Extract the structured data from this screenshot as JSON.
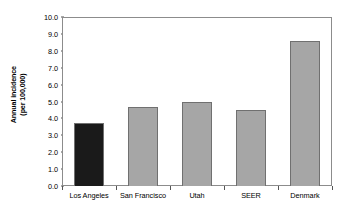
{
  "chart_data": {
    "type": "bar",
    "title": "",
    "subtitle": "",
    "xlabel": "",
    "ylabel": "Annual incidence (per 100,000)",
    "ylabel_lines": [
      "Annual incidence",
      "(per 100,000)"
    ],
    "categories": [
      "Los Angeles",
      "San Francisco",
      "Utah",
      "SEER",
      "Denmark"
    ],
    "values": [
      3.75,
      4.7,
      5.0,
      4.5,
      8.6
    ],
    "ylim": [
      0.0,
      10.0
    ],
    "ytick_step": 1.0,
    "ytick_labels": [
      "0.0",
      "1.0",
      "2.0",
      "3.0",
      "4.0",
      "5.0",
      "6.0",
      "7.0",
      "8.0",
      "9.0",
      "10.0"
    ],
    "ytick_values": [
      0.0,
      1.0,
      2.0,
      3.0,
      4.0,
      5.0,
      6.0,
      7.0,
      8.0,
      9.0,
      10.0
    ],
    "grid": false,
    "legend": false,
    "legend_position": "none",
    "bar_colors": [
      "#1a1a1a",
      "#a6a6a6",
      "#a6a6a6",
      "#a6a6a6",
      "#a6a6a6"
    ],
    "bar_outline_color": "#707070",
    "frame_color": "#8c8c8c",
    "background_color": "#ffffff",
    "highlight_category": "Los Angeles",
    "annotations": []
  }
}
